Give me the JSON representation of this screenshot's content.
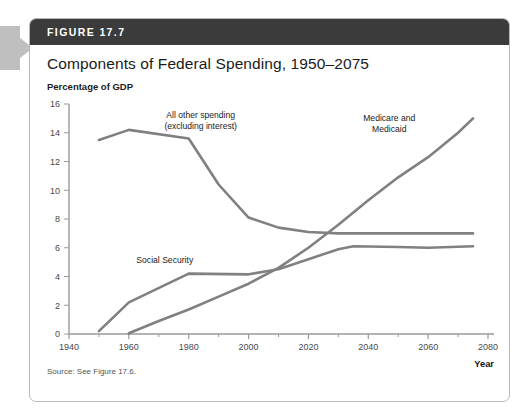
{
  "figure": {
    "header_label": "FIGURE 17.7",
    "title": "Components of Federal Spending, 1950–2075",
    "source": "Source: See Figure 17.6.",
    "header_color": "#3b3b3b",
    "line_color": "#808080",
    "axis_color": "#9a9a9a"
  },
  "chart_data": {
    "type": "line",
    "title": "Components of Federal Spending, 1950–2075",
    "xlabel": "Year",
    "ylabel": "Percentage of GDP",
    "xlim": [
      1940,
      2080
    ],
    "ylim": [
      0,
      16
    ],
    "xticks": [
      1940,
      1960,
      1980,
      2000,
      2020,
      2040,
      2060,
      2080
    ],
    "xtick_labels": [
      "1940",
      "1960",
      "1980",
      "2000",
      "2020",
      "2040",
      "2060",
      "2080"
    ],
    "xminor_ticks": [
      1950,
      1970,
      1990,
      2010,
      2030,
      2050,
      2070
    ],
    "yticks": [
      0,
      2,
      4,
      6,
      8,
      10,
      12,
      14,
      16
    ],
    "ytick_labels": [
      "0",
      "2",
      "4",
      "6",
      "8",
      "10",
      "12",
      "14",
      "16"
    ],
    "grid": false,
    "legend": "inline-annotations",
    "series": [
      {
        "name": "All other spending (excluding interest)",
        "label_lines": [
          "All other spending",
          "(excluding interest)"
        ],
        "label_anchor": "middle",
        "label_x": 1984,
        "label_y": 15.0,
        "color": "#808080",
        "x": [
          1950,
          1960,
          1980,
          1990,
          2000,
          2010,
          2020,
          2030,
          2040,
          2060,
          2075
        ],
        "y": [
          13.5,
          14.2,
          13.6,
          10.4,
          8.1,
          7.4,
          7.1,
          7.0,
          7.0,
          7.0,
          7.0
        ]
      },
      {
        "name": "Social Security",
        "label_lines": [
          "Social Security"
        ],
        "label_anchor": "middle",
        "label_x": 1972,
        "label_y": 4.95,
        "color": "#808080",
        "x": [
          1950,
          1960,
          1980,
          2000,
          2010,
          2020,
          2030,
          2035,
          2050,
          2060,
          2075
        ],
        "y": [
          0.2,
          2.2,
          4.2,
          4.15,
          4.5,
          5.2,
          5.9,
          6.1,
          6.05,
          6.0,
          6.1
        ]
      },
      {
        "name": "Medicare and Medicaid",
        "label_lines": [
          "Medicare and",
          "Medicaid"
        ],
        "label_anchor": "middle",
        "label_x": 2047,
        "label_y": 14.8,
        "color": "#808080",
        "x": [
          1960,
          1970,
          1980,
          1990,
          2000,
          2010,
          2020,
          2030,
          2040,
          2050,
          2060,
          2070,
          2075
        ],
        "y": [
          0.05,
          0.9,
          1.7,
          2.6,
          3.5,
          4.6,
          6.0,
          7.6,
          9.3,
          10.9,
          12.3,
          14.0,
          15.0
        ]
      }
    ]
  }
}
